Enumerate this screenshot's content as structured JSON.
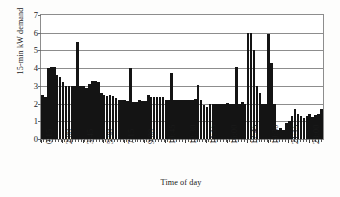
{
  "chart_data": {
    "type": "bar",
    "title": "",
    "xlabel": "Time of day",
    "ylabel": "15-min kW demand",
    "ylim": [
      0,
      7
    ],
    "yticks": [
      0,
      1,
      2,
      3,
      4,
      5,
      6,
      7
    ],
    "grid": true,
    "legend": "none",
    "bar_color": "#141414",
    "xtick_interval_bars": 7,
    "categories": [
      "0:15",
      "0:30",
      "0:45",
      "1:00",
      "1:15",
      "1:30",
      "1:45",
      "2:00",
      "2:15",
      "2:30",
      "2:45",
      "3:00",
      "3:15",
      "3:30",
      "3:45",
      "4:00",
      "4:15",
      "4:30",
      "4:45",
      "5:00",
      "5:15",
      "5:30",
      "5:45",
      "6:00",
      "6:15",
      "6:30",
      "6:45",
      "7:00",
      "7:15",
      "7:30",
      "7:45",
      "8:00",
      "8:15",
      "8:30",
      "8:45",
      "9:00",
      "9:15",
      "9:30",
      "9:45",
      "10:00",
      "10:15",
      "10:30",
      "10:45",
      "11:00",
      "11:15",
      "11:30",
      "11:45",
      "12:00",
      "12:15",
      "12:30",
      "12:45",
      "13:00",
      "13:15",
      "13:30",
      "13:45",
      "14:00",
      "14:15",
      "14:30",
      "14:45",
      "15:00",
      "15:15",
      "15:30",
      "15:45",
      "16:00",
      "16:15",
      "16:30",
      "16:45",
      "17:00",
      "17:15",
      "17:30",
      "17:45",
      "18:00",
      "18:15",
      "18:30",
      "18:45",
      "19:00",
      "19:15",
      "19:30",
      "19:45",
      "20:00",
      "20:15",
      "20:30",
      "20:45",
      "21:00",
      "21:15",
      "21:30",
      "21:45",
      "22:00",
      "22:15",
      "22:30",
      "22:45",
      "23:00",
      "23:15",
      "23:30",
      "23:45",
      "0:00"
    ],
    "tick_labels": [
      "0:15",
      "2:00",
      "3:45",
      "5:30",
      "7:15",
      "9:00",
      "10:45",
      "12:30",
      "14:15",
      "16:00",
      "17:45",
      "19:30",
      "21:15",
      "23:00"
    ],
    "values": [
      2.5,
      2.4,
      4.0,
      4.05,
      4.05,
      3.6,
      3.5,
      3.2,
      3.0,
      3.0,
      3.0,
      3.0,
      5.5,
      3.0,
      3.0,
      2.9,
      3.1,
      3.3,
      3.25,
      3.2,
      2.6,
      2.5,
      2.45,
      2.5,
      2.45,
      2.3,
      2.2,
      2.2,
      2.2,
      2.15,
      4.0,
      2.1,
      2.1,
      2.2,
      2.15,
      2.15,
      2.5,
      2.4,
      2.4,
      2.4,
      2.35,
      2.4,
      2.2,
      2.2,
      3.7,
      2.2,
      2.2,
      2.2,
      2.2,
      2.2,
      2.2,
      2.2,
      2.25,
      3.05,
      2.2,
      1.9,
      1.8,
      2.0,
      2.0,
      2.0,
      2.0,
      1.95,
      2.0,
      2.05,
      2.0,
      2.0,
      4.05,
      2.0,
      2.1,
      2.0,
      6.0,
      6.0,
      5.0,
      3.0,
      2.6,
      2.0,
      2.0,
      5.95,
      4.3,
      2.0,
      0.5,
      0.6,
      0.5,
      0.9,
      1.0,
      1.3,
      1.7,
      1.4,
      1.3,
      1.2,
      1.3,
      1.4,
      1.25,
      1.35,
      1.4,
      1.7
    ]
  }
}
